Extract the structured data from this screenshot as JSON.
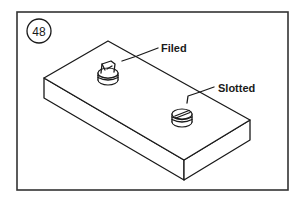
{
  "figure": {
    "number": "48",
    "labels": {
      "filed": "Filed",
      "slotted": "Slotted"
    }
  }
}
